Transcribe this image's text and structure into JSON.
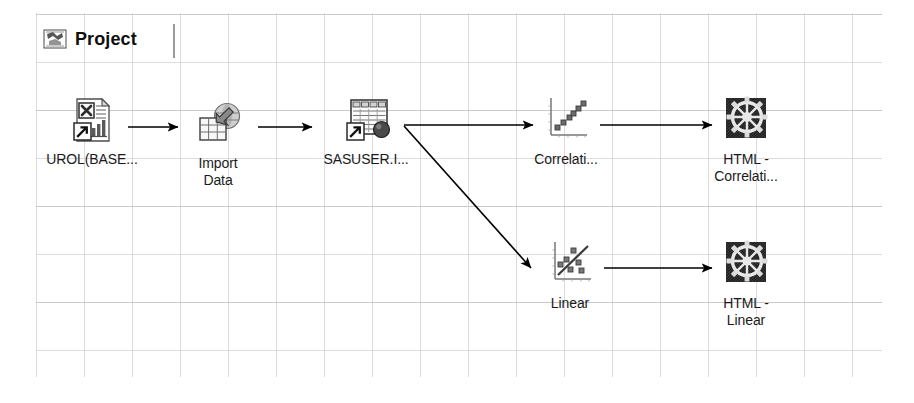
{
  "window": {
    "tab": {
      "label": "Project",
      "icon": "sas-project-icon"
    }
  },
  "canvas": {
    "grid": {
      "visible": true,
      "cell_px": 48,
      "line_color": "#dcdcdc"
    }
  },
  "diagram": {
    "type": "process-flow",
    "nodes": [
      {
        "id": "urol",
        "label": "UROL(BASE...",
        "icon": "excel-data-source-icon",
        "x": 52,
        "y": 96
      },
      {
        "id": "import-data",
        "label": "Import\nData",
        "icon": "import-data-icon",
        "x": 178,
        "y": 100
      },
      {
        "id": "sasuser",
        "label": "SASUSER.I...",
        "icon": "sas-dataset-icon",
        "x": 298,
        "y": 96
      },
      {
        "id": "correlation",
        "label": "Correlati...",
        "icon": "correlation-scatter-icon",
        "x": 478,
        "y": 96
      },
      {
        "id": "html-correlation",
        "label": "HTML -\nCorrelati...",
        "icon": "html-output-gear-icon",
        "x": 658,
        "y": 96
      },
      {
        "id": "linear",
        "label": "Linear",
        "icon": "linear-regression-icon",
        "x": 482,
        "y": 240
      },
      {
        "id": "html-linear",
        "label": "HTML -\nLinear",
        "icon": "html-output-gear-icon",
        "x": 658,
        "y": 240
      }
    ],
    "edges": [
      {
        "from": "urol",
        "to": "import-data",
        "style": "arrow"
      },
      {
        "from": "import-data",
        "to": "sasuser",
        "style": "arrow"
      },
      {
        "from": "sasuser",
        "to": "correlation",
        "style": "arrow"
      },
      {
        "from": "correlation",
        "to": "html-correlation",
        "style": "arrow"
      },
      {
        "from": "sasuser",
        "to": "linear",
        "style": "diagonal-arrow"
      },
      {
        "from": "linear",
        "to": "html-linear",
        "style": "arrow"
      }
    ]
  },
  "colors": {
    "line": "#000000",
    "grid": "#dcdcdc",
    "text": "#1a1a1a",
    "icon_dark": "#2b2b2b",
    "icon_mid": "#808080",
    "icon_light": "#d8d8d8"
  }
}
